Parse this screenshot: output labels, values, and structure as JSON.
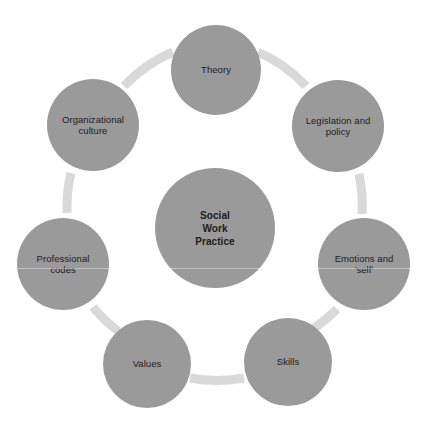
{
  "diagram": {
    "title": "Social Work Practice",
    "type": "radial-cycle",
    "center": {
      "label": "Social\nWork\nPractice",
      "cx": 215,
      "cy": 228,
      "r": 60
    },
    "ring": {
      "cx": 214,
      "cy": 218,
      "radius": 148,
      "thickness": 9,
      "color": "#d9d9d9"
    },
    "node_color": "#9a9a9a",
    "node_text_color": "#1c1c1c",
    "background": "#ffffff",
    "nodes": [
      {
        "id": "theory",
        "label": "Theory",
        "cx": 216,
        "cy": 70,
        "r": 45,
        "angle": -90
      },
      {
        "id": "legislation-and-policy",
        "label": "Legislation and\npolicy",
        "cx": 338,
        "cy": 126,
        "r": 46,
        "angle": -45
      },
      {
        "id": "emotions-and-self",
        "label": "Emotions and\n'self'",
        "cx": 364,
        "cy": 264,
        "r": 46,
        "angle": 0
      },
      {
        "id": "skills",
        "label": "Skills",
        "cx": 288,
        "cy": 362,
        "r": 44,
        "angle": 50
      },
      {
        "id": "values",
        "label": "Values",
        "cx": 147,
        "cy": 364,
        "r": 44,
        "angle": 120
      },
      {
        "id": "professional-codes",
        "label": "Professional\ncodes",
        "cx": 63,
        "cy": 264,
        "r": 46,
        "angle": 180
      },
      {
        "id": "organizational-culture",
        "label": "Organizational\nculture",
        "cx": 93,
        "cy": 125,
        "r": 46,
        "angle": -135
      }
    ],
    "caption": ""
  }
}
